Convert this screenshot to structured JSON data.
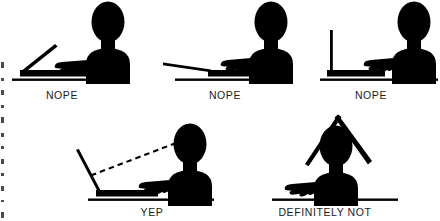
{
  "image": {
    "title": "Laptop screen angle ergonomics",
    "background_color": "#ffffff",
    "ink_color": "#000000",
    "width": 440,
    "height": 221
  },
  "rows": [
    {
      "row_index": 0,
      "panels": [
        {
          "id": "panel-nope-1",
          "caption": "NOPE",
          "screen_angle_label": "45",
          "sightline": "none",
          "description": "Person at desk with laptop screen tilted far back, low on the desk"
        },
        {
          "id": "panel-nope-2",
          "caption": "NOPE",
          "screen_angle_label": "170",
          "sightline": "none",
          "description": "Laptop screen laid almost flat on the desk"
        },
        {
          "id": "panel-nope-3",
          "caption": "NOPE",
          "screen_angle_label": "90",
          "sightline": "none",
          "description": "Laptop screen fully upright at ninety degrees"
        }
      ]
    },
    {
      "row_index": 1,
      "panels": [
        {
          "id": "panel-yep",
          "caption": "YEP",
          "screen_angle_label": "110",
          "sightline": "dashed",
          "description": "Laptop screen tilted slightly back with dashed line of sight from eyes to screen"
        },
        {
          "id": "panel-definitely-not",
          "caption": "DEFINITELY NOT",
          "screen_angle_label": "roof",
          "sightline": "none",
          "description": "Laptop held open above the head like a roof over the person"
        }
      ]
    }
  ],
  "captions": {
    "nope_1": "NOPE",
    "nope_2": "NOPE",
    "nope_3": "NOPE",
    "yep": "YEP",
    "definitely_not": "DEFINITELY NOT"
  }
}
